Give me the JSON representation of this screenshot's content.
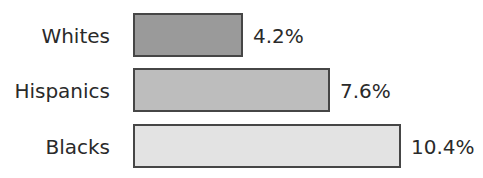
{
  "chart_data": {
    "type": "bar",
    "orientation": "horizontal",
    "title": "",
    "categories": [
      "Whites",
      "Hispanics",
      "Blacks"
    ],
    "values": [
      4.2,
      7.6,
      10.4
    ],
    "value_labels": [
      "4.2%",
      "7.6%",
      "10.4%"
    ],
    "unit": "%",
    "xlabel": "",
    "ylabel": "",
    "grid": false,
    "legend": null,
    "bar_colors": [
      "#9a9a9a",
      "#bdbdbd",
      "#e3e3e3"
    ],
    "border_color": "#464646"
  },
  "layout": {
    "px_per_unit": 25.6,
    "rows": [
      {
        "top": 13
      },
      {
        "top": 68
      },
      {
        "top": 124
      }
    ]
  }
}
